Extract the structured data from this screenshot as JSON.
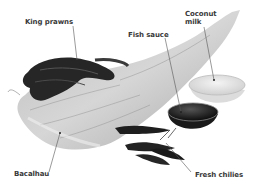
{
  "image": {
    "description": "Grayscale photo of labeled ingredients: dried salt cod, prawns, fish sauce bowl, coconut milk bowl, chilies",
    "colors": {
      "background": "#ffffff",
      "label_text": "#3a3a3a",
      "leader_line": "#555555"
    }
  },
  "labels": [
    {
      "id": "king-prawns",
      "text": "King prawns"
    },
    {
      "id": "fish-sauce",
      "text": "Fish sauce"
    },
    {
      "id": "coconut-milk",
      "line1": "Coconut",
      "line2": "milk"
    },
    {
      "id": "bacalhau",
      "text": "Bacalhau"
    },
    {
      "id": "fresh-chilies",
      "text": "Fresh chilies"
    }
  ]
}
